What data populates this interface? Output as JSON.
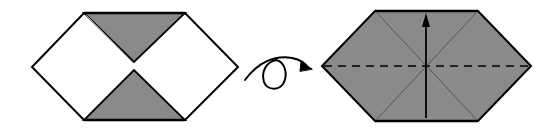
{
  "diagram": {
    "type": "origami-fold-steps",
    "colors": {
      "paper_front": "#ffffff",
      "paper_back": "#8a8a8a",
      "outline": "#000000",
      "crease": "#5a5a5a"
    },
    "steps": [
      {
        "id": "step-1",
        "description": "Hexagon with top and bottom triangular flaps folded to center (gray side showing)",
        "outline": [
          [
            32,
            67
          ],
          [
            84,
            13
          ],
          [
            185,
            13
          ],
          [
            238,
            67
          ],
          [
            185,
            120
          ],
          [
            84,
            120
          ]
        ],
        "top_flap": [
          [
            84,
            13
          ],
          [
            185,
            13
          ],
          [
            134,
            62
          ]
        ],
        "bottom_flap": [
          [
            84,
            120
          ],
          [
            185,
            120
          ],
          [
            134,
            70
          ]
        ]
      },
      {
        "id": "turn-over",
        "description": "Turn model over symbol (looped arrow)"
      },
      {
        "id": "step-2",
        "description": "Gray hexagon with diagonal creases, horizontal valley fold line, and upward fold arrow",
        "outline": [
          [
            322,
            66
          ],
          [
            375,
            11
          ],
          [
            478,
            11
          ],
          [
            531,
            66
          ],
          [
            478,
            121
          ],
          [
            375,
            121
          ]
        ],
        "center": [
          426,
          66
        ],
        "valley_fold": {
          "y": 66,
          "x1": 322,
          "x2": 531,
          "style": "dashed"
        },
        "arrow": {
          "from": [
            426,
            118
          ],
          "to": [
            426,
            14
          ],
          "direction": "up"
        }
      }
    ]
  }
}
